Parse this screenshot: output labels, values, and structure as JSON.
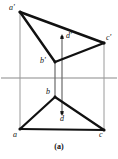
{
  "figure": {
    "caption": "(a)",
    "width": 118,
    "height": 159,
    "background": "#ffffff",
    "stroke_color": "#111111",
    "thin_stroke_color": "#8a8a8a",
    "labels": {
      "a_prime": "a'",
      "b_prime": "b'",
      "c_prime": "c'",
      "d_prime": "d'",
      "a": "a",
      "b": "b",
      "c": "c",
      "d": "d"
    },
    "label_positions": {
      "a_prime": {
        "x": 9,
        "y": 4
      },
      "b_prime": {
        "x": 40,
        "y": 57
      },
      "c_prime": {
        "x": 106,
        "y": 34
      },
      "d_prime": {
        "x": 66,
        "y": 32
      },
      "a": {
        "x": 13,
        "y": 131
      },
      "b": {
        "x": 46,
        "y": 88
      },
      "c": {
        "x": 99,
        "y": 131
      },
      "d": {
        "x": 60,
        "y": 115
      }
    },
    "points": {
      "a_prime": {
        "x": 20,
        "y": 12
      },
      "b_prime": {
        "x": 55,
        "y": 62
      },
      "c_prime": {
        "x": 104,
        "y": 43
      },
      "d_prime": {
        "x": 62,
        "y": 37
      },
      "a": {
        "x": 20,
        "y": 129
      },
      "b": {
        "x": 55,
        "y": 97
      },
      "c": {
        "x": 104,
        "y": 130
      },
      "d": {
        "x": 62,
        "y": 113
      }
    },
    "axis": {
      "label": "ground-line",
      "y": 78,
      "x_start": 1,
      "x_end": 117
    },
    "projector_lines": [
      {
        "name": "projector-a",
        "x": 20,
        "y1": 12,
        "y2": 129
      },
      {
        "name": "projector-b",
        "x": 55,
        "y1": 62,
        "y2": 97
      },
      {
        "name": "projector-d",
        "x": 62,
        "y1": 37,
        "y2": 113
      },
      {
        "name": "projector-c",
        "x": 104,
        "y1": 43,
        "y2": 130
      }
    ],
    "upper_triangle_edges": [
      {
        "name": "edge-aprime-cprime",
        "x1": 20,
        "y1": 12,
        "x2": 104,
        "y2": 43
      },
      {
        "name": "edge-aprime-bprime",
        "x1": 20,
        "y1": 12,
        "x2": 55,
        "y2": 62
      },
      {
        "name": "edge-bprime-cprime",
        "x1": 55,
        "y1": 62,
        "x2": 104,
        "y2": 43
      }
    ],
    "lower_triangle_edges": [
      {
        "name": "edge-a-b",
        "x1": 20,
        "y1": 129,
        "x2": 55,
        "y2": 97
      },
      {
        "name": "edge-a-c",
        "x1": 20,
        "y1": 129,
        "x2": 104,
        "y2": 130
      },
      {
        "name": "edge-b-c",
        "x1": 55,
        "y1": 97,
        "x2": 104,
        "y2": 130
      }
    ]
  }
}
